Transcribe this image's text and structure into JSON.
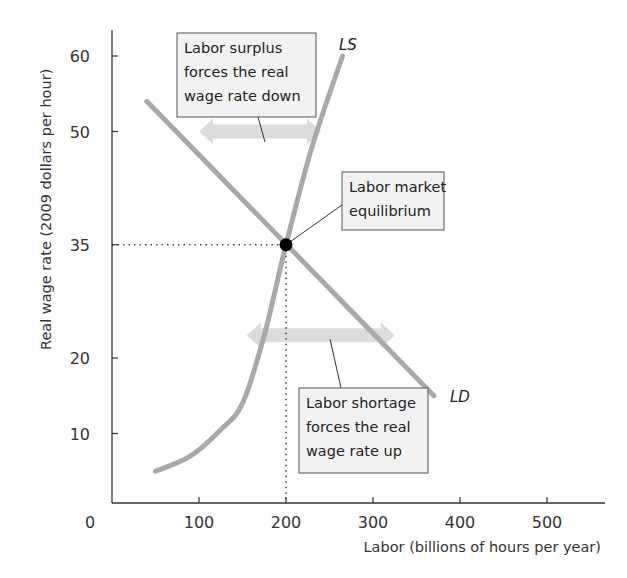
{
  "chart_data": {
    "type": "line",
    "title": "",
    "xlabel": "Labor (billions of hours per year)",
    "ylabel": "Real wage rate (2009 dollars per hour)",
    "xlim": [
      0,
      550
    ],
    "ylim": [
      0,
      64
    ],
    "x_ticks": [
      0,
      100,
      200,
      300,
      400,
      500
    ],
    "y_ticks": [
      10,
      20,
      35,
      50,
      60
    ],
    "grid": false,
    "series": [
      {
        "name": "LD",
        "label": "LD",
        "description": "Labor demand curve",
        "color": "#a9a9a9",
        "points": [
          [
            40,
            54
          ],
          [
            370,
            15
          ]
        ]
      },
      {
        "name": "LS",
        "label": "LS",
        "description": "Labor supply curve",
        "color": "#a9a9a9",
        "points": [
          [
            50,
            5
          ],
          [
            90,
            7
          ],
          [
            125,
            10.5
          ],
          [
            150,
            14
          ],
          [
            175,
            23
          ],
          [
            200,
            35
          ],
          [
            230,
            48
          ],
          [
            265,
            60
          ]
        ]
      }
    ],
    "equilibrium": {
      "x": 200,
      "y": 35,
      "label": "Labor market equilibrium"
    },
    "annotations": [
      {
        "id": "surplus",
        "lines": [
          "Labor surplus",
          "forces the real",
          "wage rate down"
        ],
        "arrow_y": 50,
        "arrow_x": [
          100,
          240
        ]
      },
      {
        "id": "equilibrium",
        "lines": [
          "Labor market",
          "equilibrium"
        ]
      },
      {
        "id": "shortage",
        "lines": [
          "Labor shortage",
          "forces the real",
          "wage rate up"
        ],
        "arrow_y": 23,
        "arrow_x": [
          155,
          325
        ]
      }
    ],
    "colors": {
      "curve": "#a9a9a9",
      "arrow": "#dcdcdc",
      "axis": "#333333",
      "box_fill": "#f2f2f2",
      "box_border": "#555555",
      "point": "#000000"
    }
  }
}
